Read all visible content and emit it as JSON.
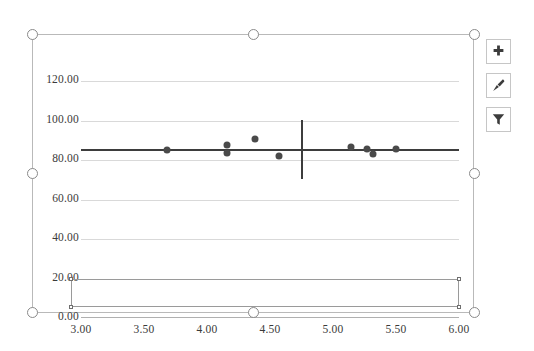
{
  "app": {
    "context": "excel-embedded-chart-selected"
  },
  "chart_buttons": [
    {
      "name": "chart-elements-button",
      "icon": "plus-icon",
      "tooltip": "Chart Elements"
    },
    {
      "name": "chart-styles-button",
      "icon": "paintbrush-icon",
      "tooltip": "Chart Styles"
    },
    {
      "name": "chart-filters-button",
      "icon": "funnel-filter-icon",
      "tooltip": "Chart Filters"
    }
  ],
  "selection": {
    "handle_count": 8,
    "handles": [
      {
        "name": "handle-top-left",
        "x": 27,
        "y": 29
      },
      {
        "name": "handle-top-center",
        "x": 248,
        "y": 29
      },
      {
        "name": "handle-top-right",
        "x": 469,
        "y": 29
      },
      {
        "name": "handle-middle-left",
        "x": 27,
        "y": 168
      },
      {
        "name": "handle-middle-right",
        "x": 469,
        "y": 168
      },
      {
        "name": "handle-bottom-left",
        "x": 27,
        "y": 307
      },
      {
        "name": "handle-bottom-center",
        "x": 248,
        "y": 307
      },
      {
        "name": "handle-bottom-right",
        "x": 469,
        "y": 307
      }
    ]
  },
  "axis_selection": {
    "label": "horizontal-axis-selected",
    "left": 70,
    "top": 278,
    "width": 388,
    "height": 28
  },
  "chart_data": {
    "type": "scatter",
    "title": "",
    "xlabel": "",
    "ylabel": "",
    "xlim": [
      3.0,
      6.0
    ],
    "ylim": [
      0.0,
      120.0
    ],
    "grid": true,
    "legend": "none",
    "xticks": [
      "3.00",
      "3.50",
      "4.00",
      "4.50",
      "5.00",
      "5.50",
      "6.00"
    ],
    "xtick_values": [
      3.0,
      3.5,
      4.0,
      4.5,
      5.0,
      5.5,
      6.0
    ],
    "yticks": [
      "0.00",
      "20.00",
      "40.00",
      "60.00",
      "80.00",
      "100.00",
      "120.00"
    ],
    "ytick_values": [
      0,
      20,
      40,
      60,
      80,
      100,
      120
    ],
    "series": [
      {
        "name": "data-points",
        "marker": "circle",
        "color": "#4a4a4a",
        "points": [
          {
            "x": 3.68,
            "y": 84.9
          },
          {
            "x": 4.16,
            "y": 87.6
          },
          {
            "x": 4.16,
            "y": 83.3
          },
          {
            "x": 4.38,
            "y": 90.4
          },
          {
            "x": 4.57,
            "y": 81.8
          },
          {
            "x": 5.14,
            "y": 86.8
          },
          {
            "x": 5.27,
            "y": 85.8
          },
          {
            "x": 5.32,
            "y": 82.9
          },
          {
            "x": 5.5,
            "y": 85.6
          }
        ]
      }
    ],
    "trendline": {
      "name": "horizontal-average-line",
      "type": "horizontal",
      "y": 85.5,
      "color": "#3d3d3d"
    },
    "marker_line": {
      "name": "vertical-reference-line",
      "type": "vertical",
      "x": 4.75,
      "y_start": 70.5,
      "y_end": 100.5,
      "color": "#3d3d3d"
    }
  }
}
